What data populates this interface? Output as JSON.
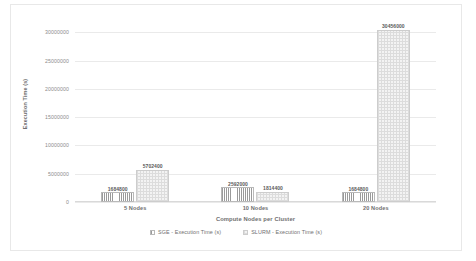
{
  "chart_data": {
    "type": "bar",
    "title": "",
    "xlabel": "Compute Nodes per Cluster",
    "ylabel": "Execution Time (s)",
    "categories": [
      "5 Nodes",
      "10 Nodes",
      "20 Nodes"
    ],
    "series": [
      {
        "name": "SGE - Execution Time (s)",
        "values": [
          1684800,
          2592000,
          1684800
        ],
        "labels": [
          "1684800",
          "2592000",
          "1684800"
        ],
        "fill": "vertical-hatch",
        "color": "#9a9a9a"
      },
      {
        "name": "SLURM - Execution Time (s)",
        "values": [
          5702400,
          1814400,
          30456000
        ],
        "labels": [
          "5702400",
          "1814400",
          "30456000"
        ],
        "fill": "checker-dot",
        "color": "#dcdcdc"
      }
    ],
    "ylim": [
      0,
      32000000
    ],
    "yticks": [
      0,
      5000000,
      10000000,
      15000000,
      20000000,
      25000000,
      30000000
    ],
    "ytick_labels": [
      "0",
      "5000000",
      "10000000",
      "15000000",
      "20000000",
      "25000000",
      "30000000"
    ],
    "grid": true,
    "legend_position": "bottom",
    "background": "#ffffff",
    "grid_color": "#eaeaea",
    "text_color": "#6f6f6f"
  }
}
